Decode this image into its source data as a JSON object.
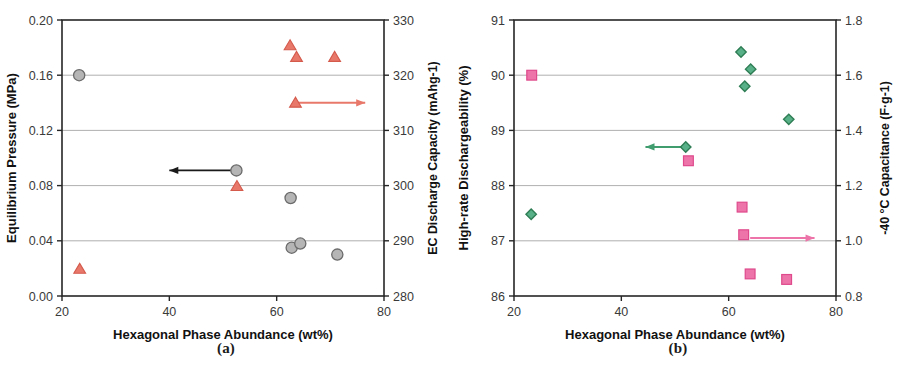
{
  "figure": {
    "panels": [
      {
        "caption": "(a)",
        "x_axis": {
          "label": "Hexagonal Phase Abundance (wt%)",
          "ticks": [
            "20",
            "40",
            "60",
            "80"
          ],
          "tick_values": [
            20,
            40,
            60,
            80
          ],
          "min": 20,
          "max": 80
        },
        "y_left": {
          "label": "Equilibrium Pressure (MPa)",
          "ticks": [
            "0.00",
            "0.04",
            "0.08",
            "0.12",
            "0.16",
            "0.20"
          ],
          "tick_values": [
            0.0,
            0.04,
            0.08,
            0.12,
            0.16,
            0.2
          ],
          "min": 0.0,
          "max": 0.2,
          "color": "#8c8c8c"
        },
        "y_right": {
          "label": "EC Discharge Capacity (mAhg-1)",
          "ticks": [
            "280",
            "290",
            "300",
            "310",
            "320",
            "330"
          ],
          "tick_values": [
            280,
            290,
            300,
            310,
            320,
            330
          ],
          "min": 280,
          "max": 330,
          "color": "#e8786a"
        },
        "annotations": [
          {
            "name": "left-arrow-to-pressure-axis",
            "color": "#1a1a1a",
            "direction": "left",
            "x_from": 52.5,
            "x_to": 40.0,
            "y_axis": "left",
            "y_value": 0.091
          },
          {
            "name": "right-arrow-to-capacity-axis",
            "color": "#e8786a",
            "direction": "right",
            "x_from": 63.5,
            "x_to": 76.5,
            "y_axis": "right",
            "y_value": 315.0
          }
        ]
      },
      {
        "caption": "(b)",
        "x_axis": {
          "label": "Hexagonal Phase Abundance (wt%)",
          "ticks": [
            "20",
            "40",
            "60",
            "80"
          ],
          "tick_values": [
            20,
            40,
            60,
            80
          ],
          "min": 20,
          "max": 80
        },
        "y_left": {
          "label": "High-rate Dischargeability (%)",
          "ticks": [
            "86",
            "87",
            "88",
            "89",
            "90",
            "91"
          ],
          "tick_values": [
            86,
            87,
            88,
            89,
            90,
            91
          ],
          "min": 86,
          "max": 91,
          "color": "#3f9d6e"
        },
        "y_right": {
          "label": "-40 °C Capacitance (F·g-1)",
          "ticks": [
            "0.8",
            "1.0",
            "1.2",
            "1.4",
            "1.6",
            "1.8"
          ],
          "tick_values": [
            0.8,
            1.0,
            1.2,
            1.4,
            1.6,
            1.8
          ],
          "min": 0.8,
          "max": 1.8,
          "color": "#ed74a8"
        },
        "annotations": [
          {
            "name": "left-arrow-to-dischargeability-axis",
            "color": "#3f9d6e",
            "direction": "left",
            "x_from": 52.0,
            "x_to": 44.5,
            "y_axis": "left",
            "y_value": 88.7
          },
          {
            "name": "right-arrow-to-capacitance-axis",
            "color": "#ed74a8",
            "direction": "right",
            "x_from": 64.0,
            "x_to": 76.0,
            "y_axis": "right",
            "y_value": 1.01
          }
        ]
      }
    ]
  },
  "chart_data": [
    {
      "type": "scatter",
      "panel": "(a)",
      "title": "",
      "xlabel": "Hexagonal Phase Abundance (wt%)",
      "ylabel": "Equilibrium Pressure (MPa)",
      "y2label": "EC Discharge Capacity (mAhg-1)",
      "xlim": [
        20,
        80
      ],
      "ylim": [
        0.0,
        0.2
      ],
      "y2lim": [
        280,
        330
      ],
      "xticks": [
        20,
        40,
        60,
        80
      ],
      "yticks": [
        0.0,
        0.04,
        0.08,
        0.12,
        0.16,
        0.2
      ],
      "y2ticks": [
        280,
        290,
        300,
        310,
        320,
        330
      ],
      "grid": true,
      "legend": "none",
      "series": [
        {
          "name": "Equilibrium Pressure (MPa)",
          "axis": "left",
          "marker": "circle",
          "color": "#b5b5b5",
          "edge_color": "#6b6b6b",
          "points": [
            {
              "x": 23.2,
              "y": 0.16
            },
            {
              "x": 52.5,
              "y": 0.091
            },
            {
              "x": 62.6,
              "y": 0.071
            },
            {
              "x": 62.8,
              "y": 0.035
            },
            {
              "x": 64.4,
              "y": 0.038
            },
            {
              "x": 71.3,
              "y": 0.03
            }
          ]
        },
        {
          "name": "EC Discharge Capacity (mAhg-1)",
          "axis": "right",
          "marker": "triangle",
          "color": "#e8786a",
          "edge_color": "#d45a4c",
          "points": [
            {
              "x": 23.3,
              "y": 284.9
            },
            {
              "x": 52.6,
              "y": 299.9
            },
            {
              "x": 62.5,
              "y": 325.4
            },
            {
              "x": 63.5,
              "y": 315.0
            },
            {
              "x": 63.7,
              "y": 323.3
            },
            {
              "x": 70.8,
              "y": 323.3
            }
          ]
        }
      ]
    },
    {
      "type": "scatter",
      "panel": "(b)",
      "title": "",
      "xlabel": "Hexagonal Phase Abundance (wt%)",
      "ylabel": "High-rate Dischargeability (%)",
      "y2label": "-40 °C Capacitance (F·g-1)",
      "xlim": [
        20,
        80
      ],
      "ylim": [
        86,
        91
      ],
      "y2lim": [
        0.8,
        1.8
      ],
      "xticks": [
        20,
        40,
        60,
        80
      ],
      "yticks": [
        86,
        87,
        88,
        89,
        90,
        91
      ],
      "y2ticks": [
        0.8,
        1.0,
        1.2,
        1.4,
        1.6,
        1.8
      ],
      "grid": true,
      "legend": "none",
      "series": [
        {
          "name": "High-rate Dischargeability (%)",
          "axis": "left",
          "marker": "diamond",
          "color": "#57b087",
          "edge_color": "#2e7d54",
          "points": [
            {
              "x": 23.2,
              "y": 87.48
            },
            {
              "x": 52.0,
              "y": 88.7
            },
            {
              "x": 62.3,
              "y": 90.42
            },
            {
              "x": 63.0,
              "y": 89.8
            },
            {
              "x": 64.1,
              "y": 90.11
            },
            {
              "x": 71.2,
              "y": 89.2
            }
          ]
        },
        {
          "name": "-40 °C Capacitance (F·g-1)",
          "axis": "right",
          "marker": "square",
          "color": "#ed74a8",
          "edge_color": "#de4a8c",
          "points": [
            {
              "x": 23.3,
              "y": 1.6
            },
            {
              "x": 52.5,
              "y": 1.29
            },
            {
              "x": 62.5,
              "y": 1.122
            },
            {
              "x": 62.8,
              "y": 1.022
            },
            {
              "x": 64.0,
              "y": 0.88
            },
            {
              "x": 70.8,
              "y": 0.86
            }
          ]
        }
      ]
    }
  ]
}
